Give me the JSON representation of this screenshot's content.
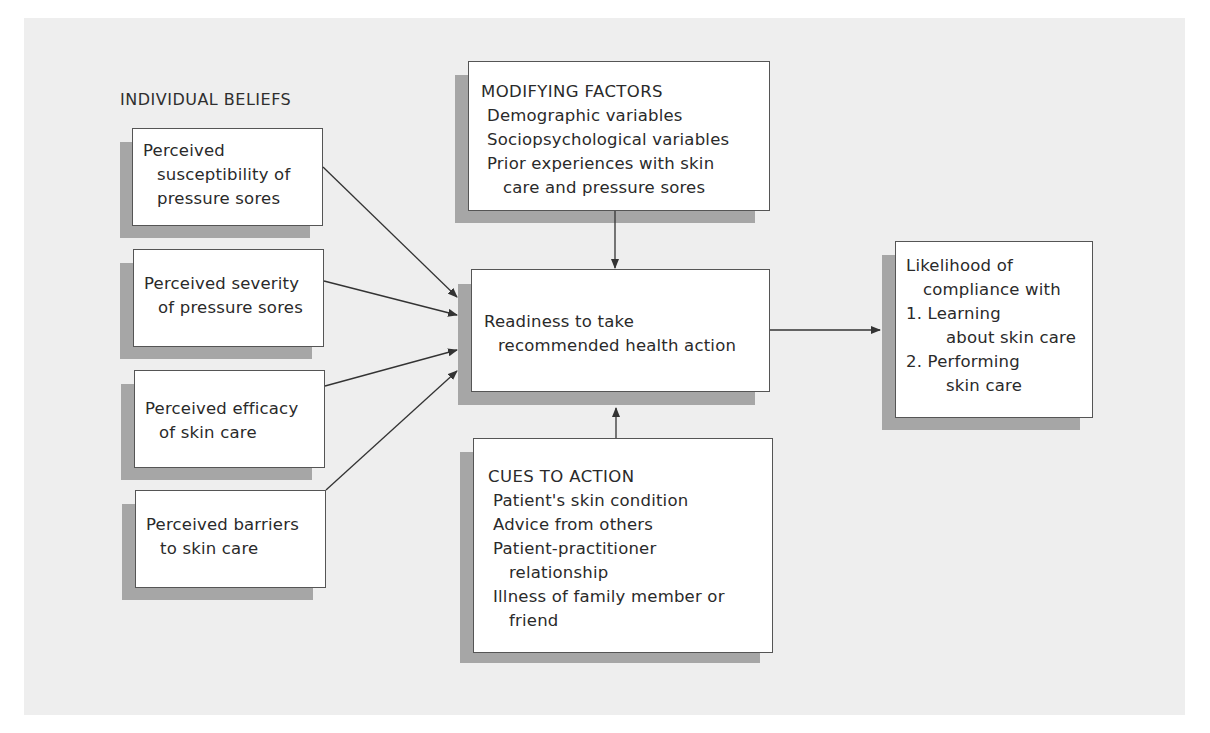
{
  "individual_beliefs": {
    "title": "INDIVIDUAL BELIEFS",
    "boxes": [
      {
        "lines": [
          "Perceived",
          "susceptibility of",
          "pressure sores"
        ]
      },
      {
        "lines": [
          "Perceived severity",
          "of pressure sores"
        ]
      },
      {
        "lines": [
          "Perceived efficacy",
          "of skin care"
        ]
      },
      {
        "lines": [
          "Perceived barriers",
          "to skin care"
        ]
      }
    ]
  },
  "modifying_factors": {
    "title": "MODIFYING FACTORS",
    "items": [
      "Demographic variables",
      "Sociopsychological variables",
      "Prior experiences with skin",
      "care and pressure sores"
    ]
  },
  "readiness": {
    "lines": [
      "Readiness to take",
      "recommended health action"
    ]
  },
  "cues_to_action": {
    "title": "CUES TO ACTION",
    "items": [
      "Patient's skin condition",
      "Advice from others",
      "Patient-practitioner",
      "relationship",
      "Illness of family member or",
      "friend"
    ]
  },
  "outcome": {
    "lines": [
      "Likelihood of",
      "compliance with",
      "1. Learning",
      "about skin care",
      "2. Performing",
      "skin care"
    ]
  },
  "colors": {
    "panel": "#eeeeee",
    "shadow": "#a6a6a6",
    "box_border": "#555555",
    "arrow": "#333333"
  }
}
